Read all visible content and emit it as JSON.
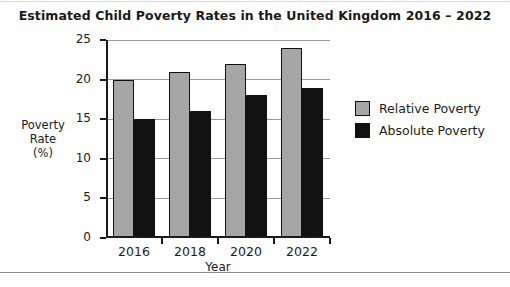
{
  "chart_data": {
    "type": "bar",
    "title": "Estimated Child Poverty Rates in the United Kingdom 2016 – 2022",
    "categories": [
      "2016",
      "2018",
      "2020",
      "2022"
    ],
    "series": [
      {
        "name": "Relative Poverty",
        "color": "#a6a6a6",
        "values": [
          20,
          21,
          22,
          24
        ]
      },
      {
        "name": "Absolute Poverty",
        "color": "#121212",
        "values": [
          15,
          16,
          18,
          19
        ]
      }
    ],
    "xlabel": "Year",
    "ylabel": "Poverty Rate (%)",
    "ylabel_lines": [
      "Poverty",
      "Rate",
      "(%)"
    ],
    "ylim": [
      0,
      25
    ],
    "ytick_labels": [
      "0",
      "5",
      "10",
      "15",
      "20",
      "25"
    ],
    "ytick_values": [
      0,
      5,
      10,
      15,
      20,
      25
    ],
    "grid": "horizontal",
    "legend_position": "right"
  }
}
